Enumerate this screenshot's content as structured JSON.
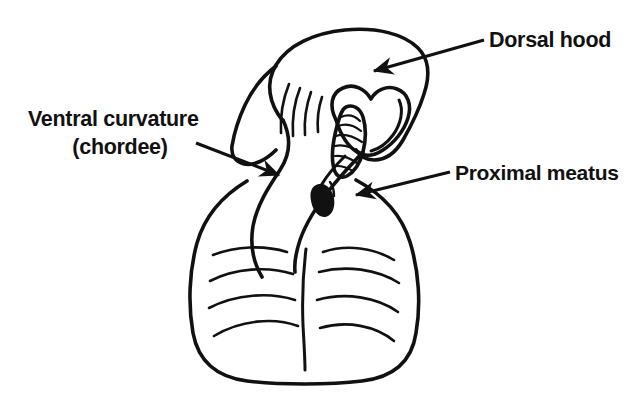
{
  "figure": {
    "background_color": "#ffffff",
    "ink_color": "#111111",
    "width": 639,
    "height": 397
  },
  "labels": {
    "dorsal_hood": {
      "text": "Dorsal hood",
      "x": 489,
      "y": 47,
      "anchor": "start"
    },
    "ventral_curvature_line1": {
      "text": "Ventral curvature",
      "x": 28,
      "y": 126,
      "anchor": "start"
    },
    "ventral_curvature_line2": {
      "text": "(chordee)",
      "x": 120,
      "y": 154,
      "anchor": "middle"
    },
    "proximal_meatus": {
      "text": "Proximal meatus",
      "x": 455,
      "y": 180,
      "anchor": "start"
    }
  },
  "leaders": [
    {
      "name": "dorsal-hood-leader",
      "from_x": 484,
      "from_y": 40,
      "to_x": 370,
      "to_y": 73
    },
    {
      "name": "ventral-curvature-leader",
      "from_x": 196,
      "from_y": 143,
      "to_x": 283,
      "to_y": 176
    },
    {
      "name": "proximal-meatus-leader",
      "from_x": 450,
      "from_y": 172,
      "to_x": 352,
      "to_y": 196
    }
  ],
  "anatomy": {
    "parts": [
      {
        "name": "dorsal-hood-outer",
        "description": "Outer prepucial hood outline"
      },
      {
        "name": "dorsal-hood-inner",
        "description": "Inner hood opening, heart shaped"
      },
      {
        "name": "glans",
        "description": "Glans penis with hatching"
      },
      {
        "name": "ventral-shaft",
        "description": "Curved ventral shaft (chordee)"
      },
      {
        "name": "urethral-meatus",
        "description": "Proximal urethral meatus, filled oval"
      },
      {
        "name": "scrotum",
        "description": "Scrotal sac with rugae"
      },
      {
        "name": "median-raphe",
        "description": "Midline raphe of scrotum"
      }
    ],
    "hood_creases": 4,
    "glans_hatch_marks": 6,
    "scrotal_rugae_left": 4,
    "scrotal_rugae_right": 4
  }
}
